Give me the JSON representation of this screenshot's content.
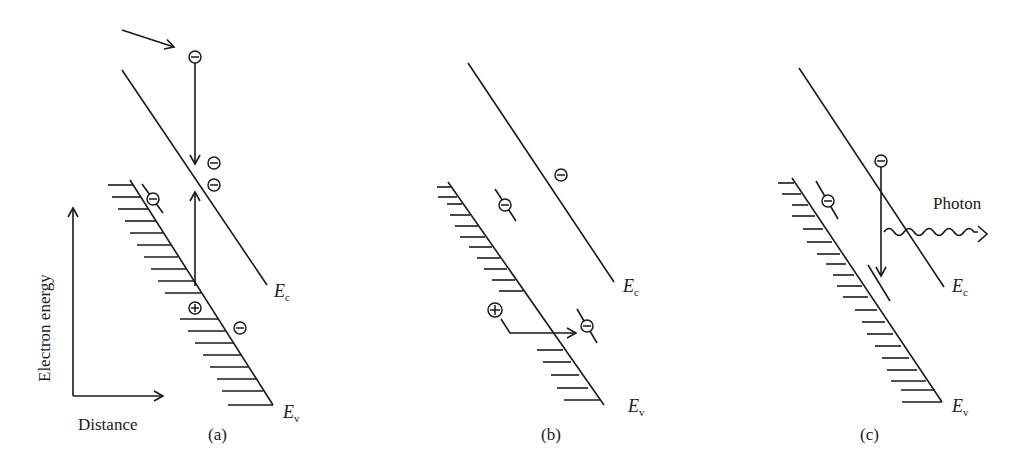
{
  "figure": {
    "axes": {
      "y_label": "Electron energy",
      "x_label": "Distance"
    },
    "panels": [
      {
        "id": "a",
        "caption": "(a)",
        "band_labels": {
          "conduction": "E",
          "conduction_sub": "c",
          "valence": "E",
          "valence_sub": "v"
        },
        "elements": [
          "incoming electron arrow",
          "electron captured to conduction band",
          "two electrons in conduction band",
          "trapped electron in gap",
          "electron excited from valence band",
          "hole in valence band",
          "electron near valence band"
        ]
      },
      {
        "id": "b",
        "caption": "(b)",
        "band_labels": {
          "conduction": "E",
          "conduction_sub": "c",
          "valence": "E",
          "valence_sub": "v"
        },
        "elements": [
          "electron in conduction band",
          "trapped electron",
          "hole transitions to trap electron"
        ]
      },
      {
        "id": "c",
        "caption": "(c)",
        "band_labels": {
          "conduction": "E",
          "conduction_sub": "c",
          "valence": "E",
          "valence_sub": "v"
        },
        "photon_label": "Photon",
        "elements": [
          "electron recombination downward",
          "photon emission",
          "trapped electron",
          "recombination level"
        ]
      }
    ],
    "symbols": {
      "electron": "−",
      "hole": "+"
    },
    "colors": {
      "ink": "#1a1a1a",
      "background": "#ffffff"
    }
  }
}
